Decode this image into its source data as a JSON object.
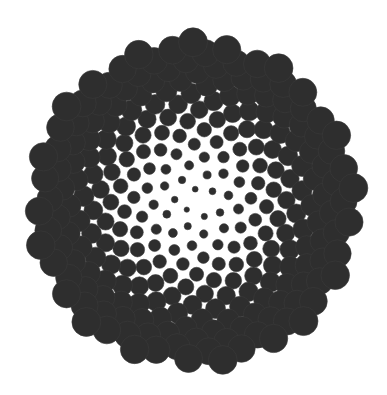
{
  "image": {
    "description": "Phyllotaxis (sunflower seed) spiral of dark gray filled circles on white background",
    "background": "#ffffff",
    "dot_color": "#2e2e2e",
    "dot_edge_color": "#3a3a3a"
  },
  "pattern": {
    "type": "vogel-phyllotaxis",
    "center": [
      194,
      203
    ],
    "count": 270,
    "golden_angle_deg": 137.508,
    "spacing": 9.8,
    "min_radius": 2.2,
    "max_radius": 14.5,
    "rotation_deg": 0
  }
}
